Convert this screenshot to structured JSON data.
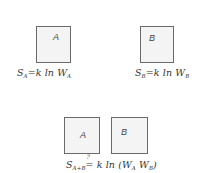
{
  "diagram": {
    "top_left": {
      "box_label": "A",
      "equation": {
        "lhs": "S",
        "lhs_sub": "A",
        "op": "=",
        "rhs": "k ln W",
        "rhs_sub": "A"
      }
    },
    "top_right": {
      "box_label": "B",
      "equation": {
        "lhs": "S",
        "lhs_sub": "B",
        "op": "=",
        "rhs": "k ln W",
        "rhs_sub": "B"
      }
    },
    "bottom": {
      "box_left_label": "A",
      "box_right_label": "B",
      "equation": {
        "lhs": "S",
        "lhs_sub": "A+B",
        "question_mark": "?",
        "op": "=",
        "rhs_prefix": "k ln (W",
        "rhs_sub1": "A",
        "rhs_mid": " W",
        "rhs_sub2": "B",
        "rhs_suffix": ")"
      }
    },
    "colors": {
      "box_border": "#6a6a6a",
      "box_fill": "#f4f4f4",
      "ink": "#333333"
    }
  }
}
